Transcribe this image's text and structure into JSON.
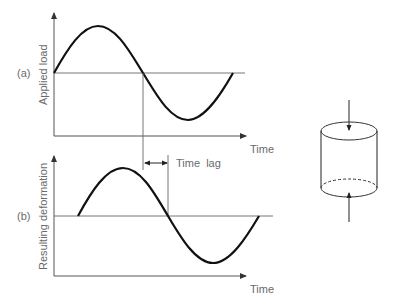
{
  "diagram": {
    "panel_a": {
      "tag": "(a)",
      "y_label": "Applied load",
      "x_label": "Time"
    },
    "panel_b": {
      "tag": "(b)",
      "y_label": "Resulting deformation",
      "x_label": "Time"
    },
    "time_lag_label": "Time  lag",
    "specimen": "cylinder-under-axial-compression"
  },
  "colors": {
    "curve": "#111111",
    "axis": "#555555",
    "label": "#6a6a6a"
  }
}
